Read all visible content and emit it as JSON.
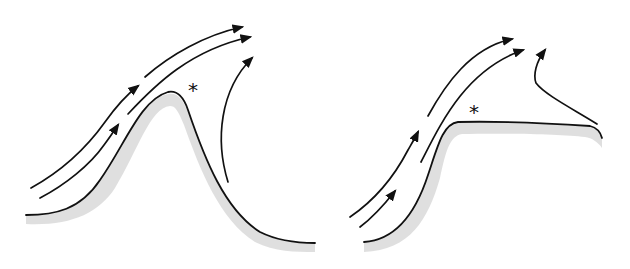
{
  "figure": {
    "panels": [
      {
        "id": "ridge",
        "description": "Airflow over an isolated ridge with lee-side separation",
        "marker": "*"
      },
      {
        "id": "escarpment",
        "description": "Airflow over an escarpment onto a plateau with separation at the edge",
        "marker": "*"
      }
    ],
    "colors": {
      "line": "#111111",
      "terrain_shading": "#d9d9d9",
      "background": "#ffffff"
    }
  }
}
